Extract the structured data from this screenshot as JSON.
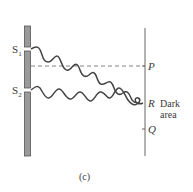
{
  "figure": {
    "caption": "(c)",
    "slits": {
      "s1": {
        "label": "S",
        "sub": "1"
      },
      "s2": {
        "label": "S",
        "sub": "2"
      }
    },
    "screen_points": {
      "p": "P",
      "r": "R",
      "q": "Q"
    },
    "annotation": {
      "line1": "Dark",
      "line2": "area"
    },
    "colors": {
      "barrier_fill": "#9a9a9a",
      "barrier_stroke": "#555555",
      "wave": "#444444",
      "screen": "#666666",
      "dashed": "#777777",
      "text": "#3a3a3a"
    }
  }
}
